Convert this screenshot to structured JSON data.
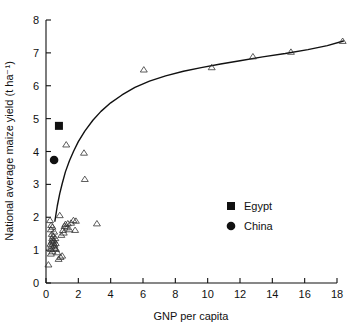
{
  "chart_data": {
    "type": "scatter",
    "title": "",
    "xlabel": "GNP per capita",
    "ylabel": "National average maize yield (t ha⁻¹)",
    "xlim": [
      0,
      18
    ],
    "ylim": [
      0,
      8
    ],
    "xticks": [
      0,
      2,
      4,
      6,
      8,
      10,
      12,
      14,
      16,
      18
    ],
    "yticks": [
      0,
      1,
      2,
      3,
      4,
      5,
      6,
      7,
      8
    ],
    "xtick_labels": [
      "0",
      "2",
      "4",
      "6",
      "8",
      "10",
      "12",
      "14",
      "16",
      "18"
    ],
    "ytick_labels": [
      "0",
      "1",
      "2",
      "3",
      "4",
      "5",
      "6",
      "7",
      "8"
    ],
    "grid": false,
    "legend_position": "inside-right",
    "series": [
      {
        "name": "Countries",
        "marker": "open-triangle",
        "points": [
          [
            0.15,
            0.55
          ],
          [
            0.3,
            0.88
          ],
          [
            0.3,
            1.02
          ],
          [
            0.28,
            1.18
          ],
          [
            0.35,
            1.25
          ],
          [
            0.33,
            1.12
          ],
          [
            0.4,
            0.95
          ],
          [
            0.42,
            1.3
          ],
          [
            0.45,
            1.22
          ],
          [
            0.48,
            1.1
          ],
          [
            0.38,
            1.35
          ],
          [
            0.5,
            1.28
          ],
          [
            0.52,
            1.15
          ],
          [
            0.55,
            1.05
          ],
          [
            0.44,
            1.42
          ],
          [
            0.36,
            1.48
          ],
          [
            0.3,
            1.62
          ],
          [
            0.32,
            1.75
          ],
          [
            0.4,
            1.7
          ],
          [
            0.25,
            1.9
          ],
          [
            0.5,
            1.55
          ],
          [
            0.58,
            1.35
          ],
          [
            0.6,
            1.2
          ],
          [
            0.62,
            1.02
          ],
          [
            0.7,
            0.92
          ],
          [
            0.78,
            0.72
          ],
          [
            0.9,
            0.78
          ],
          [
            1.0,
            0.82
          ],
          [
            0.95,
            1.45
          ],
          [
            1.05,
            1.6
          ],
          [
            1.1,
            1.52
          ],
          [
            1.15,
            1.72
          ],
          [
            1.2,
            1.78
          ],
          [
            1.3,
            1.68
          ],
          [
            1.35,
            1.8
          ],
          [
            1.45,
            1.62
          ],
          [
            1.55,
            1.82
          ],
          [
            1.7,
            1.9
          ],
          [
            1.8,
            1.6
          ],
          [
            1.85,
            1.88
          ],
          [
            0.85,
            2.05
          ],
          [
            3.15,
            1.8
          ],
          [
            1.25,
            4.2
          ],
          [
            2.35,
            3.95
          ],
          [
            2.4,
            3.15
          ],
          [
            6.05,
            6.48
          ],
          [
            10.25,
            6.55
          ],
          [
            12.8,
            6.88
          ],
          [
            15.15,
            7.02
          ],
          [
            18.35,
            7.35
          ]
        ]
      },
      {
        "name": "Egypt",
        "marker": "filled-square",
        "points": [
          [
            0.8,
            4.78
          ]
        ]
      },
      {
        "name": "China",
        "marker": "filled-circle",
        "points": [
          [
            0.5,
            3.74
          ]
        ]
      }
    ],
    "fit_curve": {
      "description": "logarithmic fit line through country points",
      "points": [
        [
          0.55,
          1.88
        ],
        [
          0.7,
          2.35
        ],
        [
          0.85,
          2.72
        ],
        [
          1.0,
          3.02
        ],
        [
          1.2,
          3.38
        ],
        [
          1.45,
          3.72
        ],
        [
          1.7,
          4.0
        ],
        [
          2.0,
          4.3
        ],
        [
          2.4,
          4.62
        ],
        [
          2.9,
          4.95
        ],
        [
          3.4,
          5.22
        ],
        [
          4.0,
          5.48
        ],
        [
          4.7,
          5.72
        ],
        [
          5.5,
          5.95
        ],
        [
          6.4,
          6.14
        ],
        [
          7.4,
          6.3
        ],
        [
          8.5,
          6.44
        ],
        [
          9.6,
          6.55
        ],
        [
          10.8,
          6.66
        ],
        [
          12.0,
          6.76
        ],
        [
          13.4,
          6.88
        ],
        [
          14.8,
          6.98
        ],
        [
          16.2,
          7.1
        ],
        [
          17.4,
          7.22
        ],
        [
          18.4,
          7.36
        ]
      ]
    },
    "legend_entries": [
      {
        "label": "Egypt",
        "marker": "filled-square"
      },
      {
        "label": "China",
        "marker": "filled-circle"
      }
    ]
  },
  "caption": {
    "partial_text": ""
  }
}
